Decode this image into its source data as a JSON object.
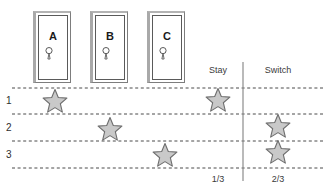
{
  "figure": {
    "background_color": "#ffffff"
  },
  "doors": [
    {
      "label": "A",
      "x": 33,
      "y": 11,
      "width": 38,
      "height": 72,
      "knob_icon": "keyhole-icon"
    },
    {
      "label": "B",
      "x": 90,
      "y": 11,
      "width": 38,
      "height": 72,
      "knob_icon": "keyhole-icon"
    },
    {
      "label": "C",
      "x": 147,
      "y": 11,
      "width": 38,
      "height": 72,
      "knob_icon": "keyhole-icon"
    }
  ],
  "columns": {
    "stay": {
      "header": "Stay",
      "total": "1/3",
      "x": 218
    },
    "switch": {
      "header": "Switch",
      "total": "2/3",
      "x": 278
    }
  },
  "rows": [
    {
      "number": "1",
      "prize_door": "A",
      "stay_win": true,
      "switch_win": false,
      "y": 101
    },
    {
      "number": "2",
      "prize_door": "B",
      "stay_win": false,
      "switch_win": true,
      "y": 128
    },
    {
      "number": "3",
      "prize_door": "C",
      "stay_win": false,
      "switch_win": true,
      "y": 155
    }
  ],
  "stars": [
    {
      "name": "prize-star-row1-door-a",
      "cx": 55,
      "cy": 102
    },
    {
      "name": "prize-star-row2-door-b",
      "cx": 110,
      "cy": 130
    },
    {
      "name": "prize-star-row3-door-c",
      "cx": 165,
      "cy": 156
    },
    {
      "name": "stay-win-star-row1",
      "cx": 218,
      "cy": 101
    },
    {
      "name": "switch-win-star-row2",
      "cx": 278,
      "cy": 127
    },
    {
      "name": "switch-win-star-row3",
      "cx": 278,
      "cy": 153
    }
  ],
  "gridlines": [
    {
      "name": "dashed-gridline-top",
      "y": 88
    },
    {
      "name": "dashed-gridline-row1",
      "y": 114
    },
    {
      "name": "dashed-gridline-row2",
      "y": 141
    },
    {
      "name": "dashed-gridline-bottom",
      "y": 168
    }
  ],
  "divider": {
    "name": "column-divider",
    "x": 243,
    "y1": 62,
    "y2": 181
  },
  "colors": {
    "star_fill": "#c9c9c9",
    "star_stroke": "#6e6e6e",
    "gridline": "#4a4a4a",
    "divider": "#8c8c8c",
    "door_outline": "#5a5a5a",
    "door_frame": "#a9a9a9",
    "text": "#3a3a3a"
  }
}
